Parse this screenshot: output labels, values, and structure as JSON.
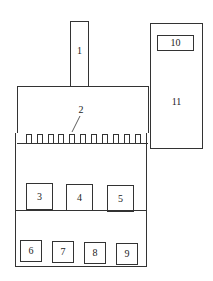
{
  "diagram": {
    "labels": {
      "b1": "1",
      "b2": "2",
      "b3": "3",
      "b4": "4",
      "b5": "5",
      "b6": "6",
      "b7": "7",
      "b8": "8",
      "b9": "9",
      "b10": "10",
      "b11": "11"
    },
    "tooth_count": 11,
    "line_color": "#333333"
  }
}
